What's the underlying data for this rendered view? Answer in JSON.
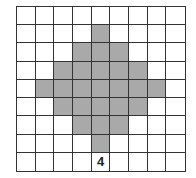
{
  "figure": {
    "rows": 9,
    "cols": 9,
    "shade_color": "#a9a9a9",
    "line_color": "#333333",
    "shaded_cells": [
      [
        1,
        4
      ],
      [
        2,
        3
      ],
      [
        2,
        4
      ],
      [
        2,
        5
      ],
      [
        3,
        2
      ],
      [
        3,
        3
      ],
      [
        3,
        4
      ],
      [
        3,
        5
      ],
      [
        3,
        6
      ],
      [
        4,
        1
      ],
      [
        4,
        2
      ],
      [
        4,
        3
      ],
      [
        4,
        4
      ],
      [
        4,
        5
      ],
      [
        4,
        6
      ],
      [
        4,
        7
      ],
      [
        5,
        2
      ],
      [
        5,
        3
      ],
      [
        5,
        4
      ],
      [
        5,
        5
      ],
      [
        5,
        6
      ],
      [
        6,
        3
      ],
      [
        6,
        4
      ],
      [
        6,
        5
      ],
      [
        7,
        4
      ]
    ],
    "labels": [
      {
        "row": 8,
        "col": 4,
        "text": "4"
      }
    ]
  }
}
